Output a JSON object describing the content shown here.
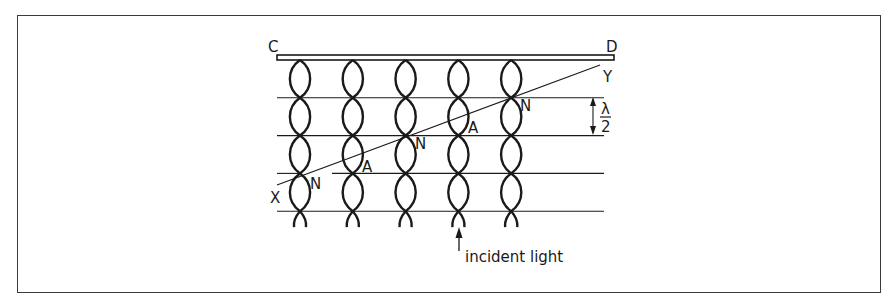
{
  "diagram": {
    "labels": {
      "plate_left": "C",
      "plate_right": "D",
      "line_start": "X",
      "line_end": "Y",
      "nodes": [
        "N",
        "N",
        "N"
      ],
      "antinodes": [
        "A",
        "A"
      ],
      "spacing_numerator": "λ",
      "spacing_denominator": "2",
      "incident": "incident light"
    },
    "fibers": 5,
    "loops_per_fiber": 4,
    "nodal_planes": 4,
    "colors": {
      "ink": "#1a1a1a",
      "frame": "#3a3a3a",
      "background": "#ffffff"
    }
  }
}
